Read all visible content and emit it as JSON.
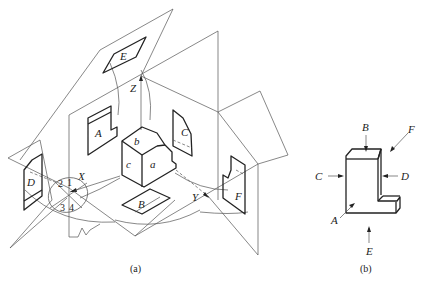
{
  "figure_a": {
    "caption": "(a)",
    "axes": {
      "x": "X",
      "y": "Y",
      "z": "Z"
    },
    "object_faces": {
      "front": "a",
      "top": "b",
      "left": "c"
    },
    "projections": {
      "A": "A",
      "B": "B",
      "C": "C",
      "D": "D",
      "E": "E",
      "F": "F"
    },
    "quadrants": [
      "1",
      "2",
      "3",
      "4"
    ]
  },
  "figure_b": {
    "caption": "(b)",
    "view_directions": {
      "A": "A",
      "B": "B",
      "C": "C",
      "D": "D",
      "E": "E",
      "F": "F"
    }
  }
}
